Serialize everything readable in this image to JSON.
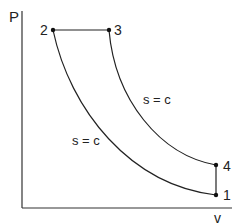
{
  "diagram": {
    "type": "thermodynamic-cycle",
    "axes": {
      "y_label": "P",
      "x_label": "v"
    },
    "points": [
      {
        "id": "1",
        "label": "1"
      },
      {
        "id": "2",
        "label": "2"
      },
      {
        "id": "3",
        "label": "3"
      },
      {
        "id": "4",
        "label": "4"
      }
    ],
    "processes": [
      {
        "from": "1",
        "to": "2",
        "kind": "isentropic",
        "label": "s = c"
      },
      {
        "from": "2",
        "to": "3",
        "kind": "constant-pressure",
        "label": ""
      },
      {
        "from": "3",
        "to": "4",
        "kind": "isentropic",
        "label": "s = c"
      },
      {
        "from": "4",
        "to": "1",
        "kind": "constant-volume",
        "label": ""
      }
    ],
    "colors": {
      "line": "#222222",
      "axis": "#333333",
      "background": "#ffffff"
    }
  }
}
